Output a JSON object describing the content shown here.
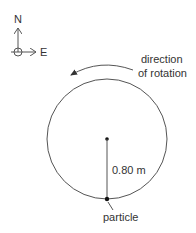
{
  "compass": {
    "north_label": "N",
    "east_label": "E"
  },
  "rotation": {
    "line1": "direction",
    "line2": "of rotation",
    "direction": "counterclockwise"
  },
  "circle": {
    "radius_label": "0.80 m"
  },
  "particle": {
    "label": "particle"
  },
  "colors": {
    "stroke": "#555555",
    "text": "#333333",
    "dot": "#111111"
  }
}
